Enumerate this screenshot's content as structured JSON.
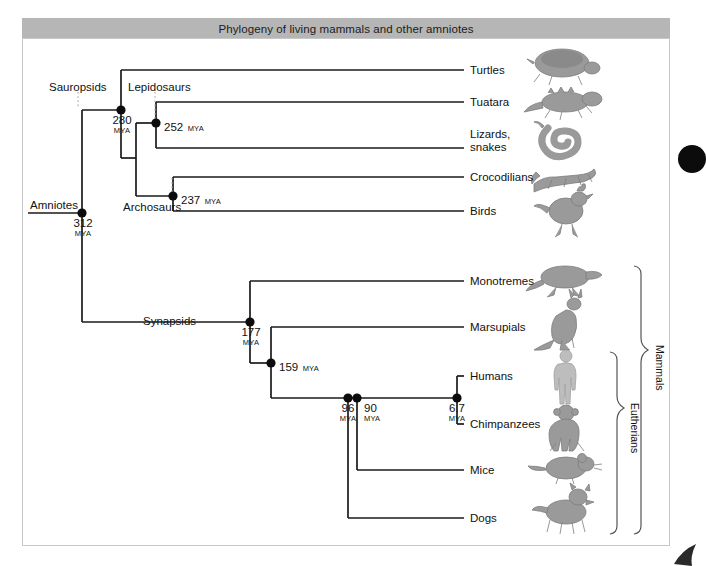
{
  "figure": {
    "title": "Phylogeny of living mammals and other amniotes",
    "width": 694,
    "height": 566,
    "colors": {
      "title_bar": "#b6b6b6",
      "frame_border": "#c8c8c8",
      "branch": "#1a1a1a",
      "node": "#0c0c0c",
      "silhouette": "#8e8e8e",
      "dotted_guide": "#b0b0b0",
      "text": "#111111"
    }
  },
  "tips": [
    {
      "id": "turtles",
      "label": "Turtles",
      "x": 470,
      "y": 70,
      "icon": "turtle-silhouette"
    },
    {
      "id": "tuatara",
      "label": "Tuatara",
      "x": 470,
      "y": 102,
      "icon": "tuatara-silhouette"
    },
    {
      "id": "lizards",
      "label": "Lizards,",
      "label2": "snakes",
      "x": 470,
      "y": 134,
      "icon": "snake-silhouette"
    },
    {
      "id": "crocodilians",
      "label": "Crocodilians",
      "x": 470,
      "y": 177,
      "icon": "crocodile-silhouette"
    },
    {
      "id": "birds",
      "label": "Birds",
      "x": 470,
      "y": 211,
      "icon": "bird-silhouette"
    },
    {
      "id": "monotremes",
      "label": "Monotremes",
      "x": 470,
      "y": 281,
      "icon": "platypus-silhouette"
    },
    {
      "id": "marsupials",
      "label": "Marsupials",
      "x": 470,
      "y": 327,
      "icon": "kangaroo-silhouette"
    },
    {
      "id": "humans",
      "label": "Humans",
      "x": 470,
      "y": 376,
      "icon": "human-silhouette"
    },
    {
      "id": "chimpanzees",
      "label": "Chimpanzees",
      "x": 470,
      "y": 424,
      "icon": "chimpanzee-silhouette"
    },
    {
      "id": "mice",
      "label": "Mice",
      "x": 470,
      "y": 470,
      "icon": "mouse-silhouette"
    },
    {
      "id": "dogs",
      "label": "Dogs",
      "x": 470,
      "y": 518,
      "icon": "dog-silhouette"
    }
  ],
  "clades": [
    {
      "id": "amniotes",
      "label": "Amniotes",
      "x": 30,
      "y": 206
    },
    {
      "id": "sauropsids",
      "label": "Sauropsids",
      "x": 49,
      "y": 88
    },
    {
      "id": "lepidosaurs",
      "label": "Lepidosaurs",
      "x": 128,
      "y": 88
    },
    {
      "id": "archosaurs",
      "label": "Archosaurs",
      "x": 123,
      "y": 207
    },
    {
      "id": "synapsids",
      "label": "Synapsids",
      "x": 143,
      "y": 321
    }
  ],
  "nodes": [
    {
      "id": "amniotes-node",
      "age": "312",
      "unit": "MYA",
      "x": 82,
      "y": 213,
      "label_pos": "below"
    },
    {
      "id": "sauropsids-node",
      "age": "280",
      "unit": "MYA",
      "x": 121,
      "y": 110,
      "label_pos": "below"
    },
    {
      "id": "lepidosaurs-node",
      "age": "252",
      "unit": "MYA",
      "x": 156,
      "y": 123,
      "label_pos": "right"
    },
    {
      "id": "archosaurs-node",
      "age": "237",
      "unit": "MYA",
      "x": 173,
      "y": 196,
      "label_pos": "right"
    },
    {
      "id": "synapsids-node",
      "age": "177",
      "unit": "MYA",
      "x": 250,
      "y": 322,
      "label_pos": "below"
    },
    {
      "id": "theria-node",
      "age": "159",
      "unit": "MYA",
      "x": 271,
      "y": 363,
      "label_pos": "right"
    },
    {
      "id": "eutheria-node",
      "age": "96",
      "unit": "MYA",
      "x": 348,
      "y": 398,
      "label_pos": "below"
    },
    {
      "id": "boreo-node",
      "age": "90",
      "unit": "MYA",
      "x": 357,
      "y": 398,
      "label_pos": "below"
    },
    {
      "id": "hominin-node",
      "age": "6.7",
      "unit": "MYA",
      "x": 457,
      "y": 398,
      "label_pos": "below"
    }
  ],
  "brackets": [
    {
      "id": "mammals",
      "label": "Mammals",
      "x": 640,
      "top": 264,
      "bottom": 536,
      "label_x": 663,
      "label_y": 350
    },
    {
      "id": "eutherians",
      "label": "Eutherians",
      "x": 616,
      "top": 350,
      "bottom": 536,
      "label_x": 637,
      "label_y": 408
    }
  ]
}
